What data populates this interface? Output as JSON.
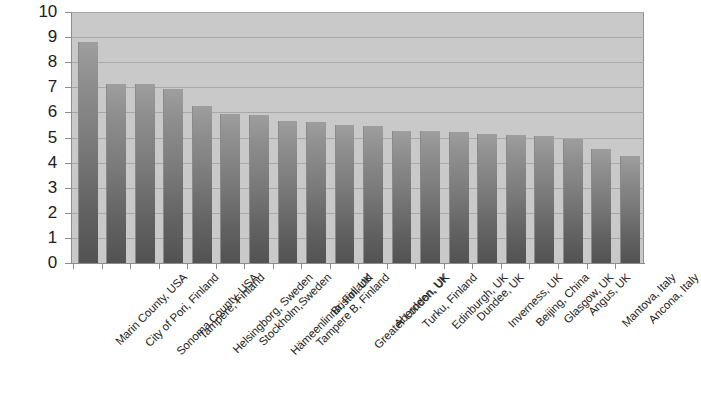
{
  "chart_data": {
    "type": "bar",
    "title": "",
    "subtitle": "",
    "xlabel": "",
    "ylabel": "",
    "ylim": [
      0,
      10
    ],
    "grid": true,
    "legend": false,
    "orientation": "vertical",
    "categories": [
      "Marin County, USA",
      "City of Pori, Finland",
      "Sonoma County, USA",
      "Tampere, Finland",
      "Helsingborg, Sweden",
      "Stockholm,Sweden",
      "Hämeenlinna, Finland",
      "Tampere B, Finland",
      "Bristol, UK",
      "Greater London, UK",
      "Aberdeen, UK",
      "Turku, Finland",
      "Edinburgh, UK",
      "Dundee, UK",
      "Inverness, UK",
      "Beijing, China",
      "Glasgow, UK",
      "Angus, UK",
      "Mantova, Italy",
      "Ancona, Italy"
    ],
    "values": [
      8.8,
      7.15,
      7.15,
      6.95,
      6.25,
      5.95,
      5.9,
      5.65,
      5.6,
      5.5,
      5.45,
      5.25,
      5.25,
      5.2,
      5.15,
      5.1,
      5.05,
      4.95,
      4.55,
      4.25
    ],
    "y_ticks": [
      0,
      1,
      2,
      3,
      4,
      5,
      6,
      7,
      8,
      9,
      10
    ],
    "y_tick_labels": [
      "0",
      "1",
      "2",
      "3",
      "4",
      "5",
      "6",
      "7",
      "8",
      "9",
      "10"
    ],
    "x_label_rotation": -45,
    "colors": {
      "plot_background": "#c9c9c9",
      "gridline": "#a8a8a8",
      "axis_line": "#8d8d8d",
      "bar_top": "#9e9e9e",
      "bar_bottom": "#525252",
      "page_background": "#ffffff",
      "text": "#1d1d1d"
    }
  }
}
